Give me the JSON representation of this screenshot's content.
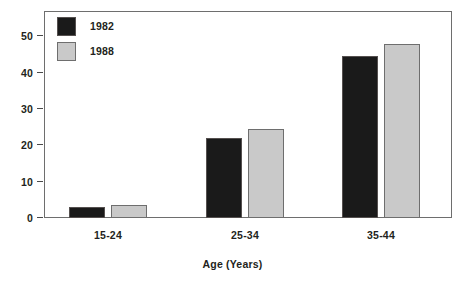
{
  "chart_data": {
    "type": "bar",
    "title": "",
    "subtitle": "",
    "xlabel": "Age (Years)",
    "ylabel": "",
    "categories": [
      "15-24",
      "25-34",
      "35-44"
    ],
    "series": [
      {
        "name": "1982",
        "color": "#1a1a1a",
        "values": [
          3,
          22,
          44.5
        ]
      },
      {
        "name": "1988",
        "color": "#c9c9c9",
        "values": [
          3.5,
          24.5,
          48
        ]
      }
    ],
    "ylim": [
      0,
      57
    ],
    "yticks": [
      0,
      10,
      20,
      30,
      40,
      50
    ],
    "ytick_labels": [
      "0",
      "10",
      "20",
      "30",
      "40",
      "50"
    ],
    "grid": false,
    "legend_position": "top-left",
    "frame": true
  }
}
